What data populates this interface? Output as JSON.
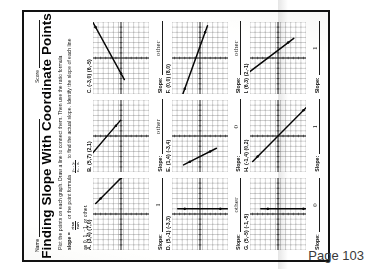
{
  "worksheet": {
    "name_label": "Name",
    "score_label": "Score",
    "title": "Finding Slope With Coordinate Points",
    "instructions": {
      "line1": "Plot the points on each graph. Draw a line to connect them. Then use the ratio formula",
      "slope_word": "slope =",
      "ratio_num": "rise",
      "ratio_den": "run",
      "line2_mid": "or the point formula",
      "point_num": "y₂ - y₁",
      "point_den": "x₂ - x₁",
      "line2_end": "to find the actual slope. Identify the slope of each line",
      "line3": "as 0, 1, ⁻1, or other."
    },
    "slope_label": "Slope:",
    "page_number": "Page 103"
  },
  "problems": [
    {
      "id": "A",
      "label": "A.",
      "points": "(3,4)   (7,0)",
      "p1": [
        3,
        4
      ],
      "p2": [
        7,
        0
      ],
      "answer": "1",
      "answer_blank": false
    },
    {
      "id": "B",
      "label": "B.",
      "points": "(5,7)   (2,1)",
      "p1": [
        -5,
        7
      ],
      "p2": [
        2,
        1
      ],
      "answer": "other",
      "answer_blank": false
    },
    {
      "id": "C",
      "label": "C.",
      "points": "(-3,0)   (6,-5)",
      "p1": [
        -3,
        0
      ],
      "p2": [
        6,
        5
      ],
      "answer": "other",
      "answer_blank": false
    },
    {
      "id": "D",
      "label": "D.",
      "points": "(5,-1)   (-3,3)",
      "p1": [
        1,
        -4
      ],
      "p2": [
        1,
        3
      ],
      "answer": "other",
      "answer_blank": false
    },
    {
      "id": "E",
      "label": "E.",
      "points": "(1,4)   (-3,4)",
      "p1": [
        -5,
        2
      ],
      "p2": [
        -3,
        -2
      ],
      "answer": "0",
      "answer_blank": false
    },
    {
      "id": "F",
      "label": "F.",
      "points": "(0,0)   (8,0)",
      "p1": [
        -6,
        3
      ],
      "p2": [
        5,
        -1
      ],
      "answer": "other",
      "answer_blank": false
    },
    {
      "id": "G",
      "label": "G.",
      "points": "(5,-5)   (-1,-5)",
      "p1": [
        1,
        -5
      ],
      "p2": [
        1,
        2
      ],
      "answer": "0",
      "answer_blank": false
    },
    {
      "id": "H",
      "label": "H.",
      "points": "(-1,4)   (0,2)",
      "p1": [
        -4,
        4
      ],
      "p2": [
        5,
        -5
      ],
      "answer": "1",
      "answer_blank": false
    },
    {
      "id": "I",
      "label": "I.",
      "points": "(6,3)   (2,-1)",
      "p1": [
        -3,
        6
      ],
      "p2": [
        3,
        -2
      ],
      "answer": "1",
      "answer_blank": false
    }
  ],
  "graph": {
    "grid_min": -7,
    "grid_max": 7,
    "grid_color": "#7d7d7d",
    "axis_color": "#1a1a1a",
    "line_color": "#111111"
  }
}
